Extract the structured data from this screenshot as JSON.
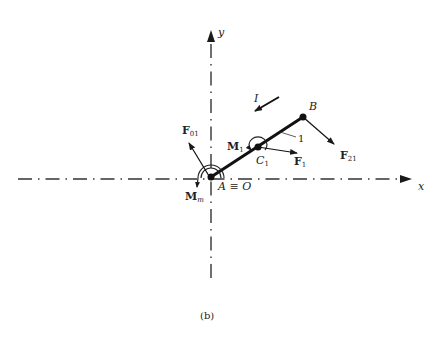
{
  "figure": {
    "caption": "(b)",
    "axes": {
      "x_label": "x",
      "y_label": "y"
    },
    "points": {
      "origin_label": "A ≡ O",
      "B_label": "B",
      "C1_label": "C",
      "C1_sub": "1",
      "link_label": "1"
    },
    "forces": {
      "F01": {
        "label": "F",
        "sub": "01"
      },
      "F1": {
        "label": "F",
        "sub": "1"
      },
      "F21": {
        "label": "F",
        "sub": "21"
      }
    },
    "moments": {
      "M1": {
        "label": "M",
        "sub": "1"
      },
      "Mm": {
        "label": "M",
        "sub": "m"
      }
    },
    "inertia_label": "I"
  }
}
